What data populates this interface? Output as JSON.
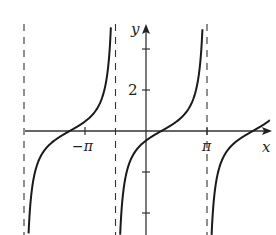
{
  "chart_data": {
    "type": "line",
    "title": "",
    "xlabel": "x",
    "ylabel": "y",
    "x_tick_labels": [
      "−π",
      "π"
    ],
    "x_ticks": [
      -3.14159,
      3.14159
    ],
    "y_tick_labels": [
      "2"
    ],
    "y_ticks": [
      -4,
      -2,
      2,
      4
    ],
    "grid": false,
    "function_description": "tangent-type curve with period 3π/2",
    "period": 4.712,
    "vertical_asymptotes": [
      -6.2832,
      -1.5708,
      3.1416
    ],
    "zeros": [
      -3.93,
      0.79,
      5.5
    ],
    "xlim": [
      -6.4,
      6.6
    ],
    "ylim": [
      -5.1,
      5.1
    ],
    "series": [
      {
        "name": "branch-left",
        "domain": [
          -6.2832,
          -1.5708
        ]
      },
      {
        "name": "branch-middle",
        "domain": [
          -1.5708,
          3.1416
        ]
      },
      {
        "name": "branch-right",
        "domain": [
          3.1416,
          6.5
        ]
      }
    ]
  },
  "axes": {
    "x_label": "x",
    "y_label": "y",
    "neg_pi_label": "−π",
    "pi_label": "π",
    "y_two_label": "2"
  },
  "colors": {
    "curve": "#1a1a1a",
    "axis": "#333333",
    "asymptote": "#333333"
  }
}
